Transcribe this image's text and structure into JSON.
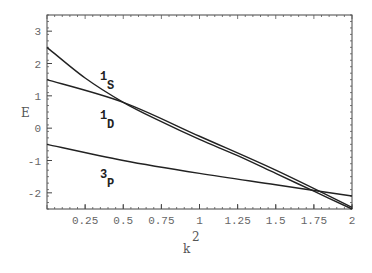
{
  "chart_data": {
    "type": "line",
    "title": "",
    "xlabel": "k^2",
    "ylabel": "E",
    "xlim": [
      0,
      2
    ],
    "ylim": [
      -2.5,
      3.5
    ],
    "x_ticks": [
      "0.25",
      "0.5",
      "0.75",
      "1",
      "1.25",
      "1.5",
      "1.75",
      "2"
    ],
    "y_ticks": [
      "3",
      "2",
      "1",
      "0",
      "-1",
      "-2"
    ],
    "grid": false,
    "legend": "inline labels",
    "series": [
      {
        "name": "1S",
        "label_main": "1",
        "label_sub": "S",
        "x": [
          0,
          0.25,
          0.5,
          0.75,
          1.0,
          1.25,
          1.5,
          1.75,
          2.0
        ],
        "y": [
          2.5,
          1.55,
          0.8,
          0.2,
          -0.35,
          -0.85,
          -1.4,
          -1.95,
          -2.5
        ]
      },
      {
        "name": "1D",
        "label_main": "1",
        "label_sub": "D",
        "x": [
          0,
          0.5,
          1.0,
          1.5,
          2.0
        ],
        "y": [
          1.5,
          0.8,
          -0.25,
          -1.3,
          -2.45
        ]
      },
      {
        "name": "3P",
        "label_main": "3",
        "label_sub": "P",
        "x": [
          0,
          0.5,
          1.0,
          1.5,
          2.0
        ],
        "y": [
          -0.5,
          -1.0,
          -1.4,
          -1.75,
          -2.1
        ]
      }
    ]
  }
}
